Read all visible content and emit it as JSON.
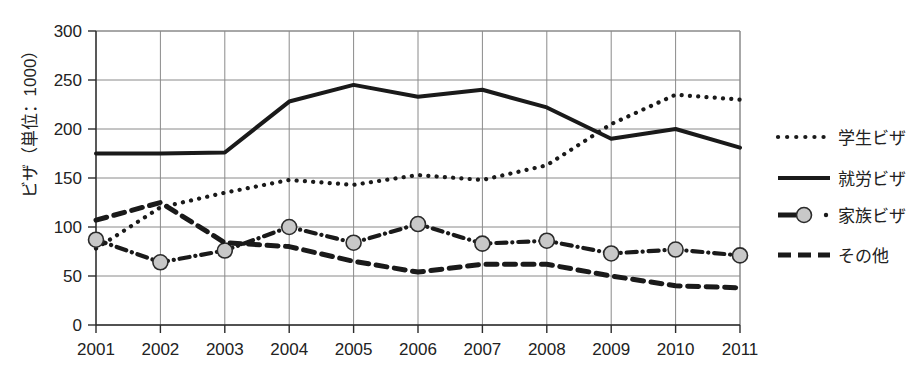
{
  "chart_data": {
    "type": "line",
    "title": "",
    "subtitle": "",
    "xlabel": "",
    "ylabel": "ビザ（単位：1000）",
    "categories": [
      "2001",
      "2002",
      "2003",
      "2004",
      "2005",
      "2006",
      "2007",
      "2008",
      "2009",
      "2010",
      "2011"
    ],
    "x": [
      2001,
      2002,
      2003,
      2004,
      2005,
      2006,
      2007,
      2008,
      2009,
      2010,
      2011
    ],
    "xlim": [
      2001,
      2011
    ],
    "ylim": [
      0,
      300
    ],
    "y_ticks": [
      0,
      50,
      100,
      150,
      200,
      250,
      300
    ],
    "y_tick_labels": [
      "0",
      "50",
      "100",
      "150",
      "200",
      "250",
      "300"
    ],
    "grid": true,
    "legend_position": "right",
    "series": [
      {
        "name": "学生ビザ",
        "style": "dotted",
        "marker": "none",
        "values": [
          78,
          120,
          135,
          148,
          143,
          153,
          148,
          163,
          205,
          235,
          230
        ]
      },
      {
        "name": "就労ビザ",
        "style": "solid",
        "marker": "none",
        "values": [
          175,
          175,
          176,
          228,
          245,
          233,
          240,
          222,
          190,
          200,
          181
        ]
      },
      {
        "name": "家族ビザ",
        "style": "dash-dot",
        "marker": "circle",
        "values": [
          87,
          64,
          76,
          100,
          84,
          103,
          83,
          86,
          73,
          77,
          71
        ]
      },
      {
        "name": "その他",
        "style": "dashed",
        "marker": "none",
        "values": [
          107,
          125,
          84,
          80,
          65,
          54,
          62,
          62,
          50,
          40,
          38
        ]
      }
    ]
  },
  "legend": {
    "items": [
      {
        "label": "学生ビザ",
        "style": "dotted"
      },
      {
        "label": "就労ビザ",
        "style": "solid"
      },
      {
        "label": "家族ビザ",
        "style": "dash-dot-marker"
      },
      {
        "label": "その他",
        "style": "dashed"
      }
    ]
  },
  "colors": {
    "line": "#1a1a1a",
    "grid": "#8a8a8a",
    "axis": "#2b2b2b",
    "marker_fill": "#c8c8c8",
    "background": "#ffffff"
  }
}
